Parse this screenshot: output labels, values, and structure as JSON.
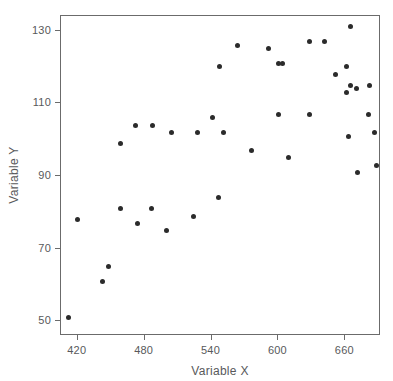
{
  "chart_data": {
    "type": "scatter",
    "title": "",
    "xlabel": "Variable X",
    "ylabel": "Variable Y",
    "xlim": [
      405,
      692
    ],
    "ylim": [
      46,
      134
    ],
    "xticks": [
      420,
      480,
      540,
      600,
      660
    ],
    "yticks": [
      50,
      70,
      90,
      110,
      130
    ],
    "xtick_labels": [
      "420",
      "480",
      "540",
      "600",
      "660"
    ],
    "ytick_labels": [
      "50",
      "70",
      "90",
      "110",
      "130"
    ],
    "grid": false,
    "legend": null,
    "marker": {
      "shape": "circle",
      "color": "#2b2b2b",
      "size": 5
    },
    "axes_color": "#6b6b6b",
    "text_color": "#58595b",
    "background": "#ffffff",
    "n_points": 40,
    "points": [
      {
        "x": 412,
        "y": 51
      },
      {
        "x": 420,
        "y": 78
      },
      {
        "x": 442,
        "y": 61
      },
      {
        "x": 448,
        "y": 65
      },
      {
        "x": 458,
        "y": 99
      },
      {
        "x": 458,
        "y": 81
      },
      {
        "x": 472,
        "y": 104
      },
      {
        "x": 474,
        "y": 77
      },
      {
        "x": 486,
        "y": 81
      },
      {
        "x": 487,
        "y": 104
      },
      {
        "x": 500,
        "y": 75
      },
      {
        "x": 504,
        "y": 102
      },
      {
        "x": 524,
        "y": 79
      },
      {
        "x": 527,
        "y": 102
      },
      {
        "x": 541,
        "y": 106
      },
      {
        "x": 546,
        "y": 84
      },
      {
        "x": 547,
        "y": 120
      },
      {
        "x": 551,
        "y": 102
      },
      {
        "x": 563,
        "y": 126
      },
      {
        "x": 576,
        "y": 97
      },
      {
        "x": 591,
        "y": 125
      },
      {
        "x": 600,
        "y": 121
      },
      {
        "x": 604,
        "y": 121
      },
      {
        "x": 600,
        "y": 107
      },
      {
        "x": 609,
        "y": 95
      },
      {
        "x": 628,
        "y": 127
      },
      {
        "x": 628,
        "y": 107
      },
      {
        "x": 641,
        "y": 127
      },
      {
        "x": 651,
        "y": 118
      },
      {
        "x": 661,
        "y": 120
      },
      {
        "x": 661,
        "y": 113
      },
      {
        "x": 663,
        "y": 101
      },
      {
        "x": 665,
        "y": 115
      },
      {
        "x": 665,
        "y": 131
      },
      {
        "x": 670,
        "y": 114
      },
      {
        "x": 671,
        "y": 91
      },
      {
        "x": 681,
        "y": 107
      },
      {
        "x": 682,
        "y": 115
      },
      {
        "x": 686,
        "y": 102
      },
      {
        "x": 688,
        "y": 93
      }
    ]
  }
}
